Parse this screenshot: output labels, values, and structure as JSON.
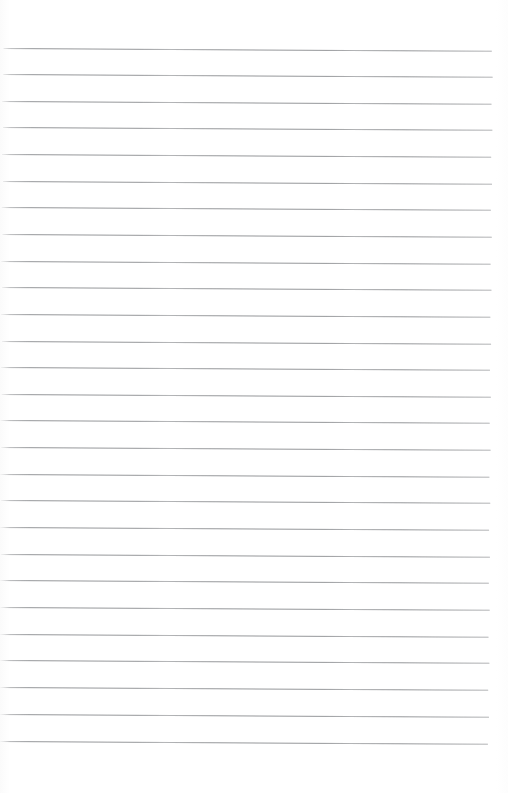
{
  "document": {
    "kind": "lined-paper-scan",
    "title": "Blank ruled notepad page",
    "page_width": 508,
    "page_height": 793,
    "background_color": "#ffffff",
    "rule_color": "#8d8f92",
    "rule_thickness_px": 1,
    "skew_degrees": 0.32,
    "content_text": "",
    "handwriting_present": "no",
    "ruling": {
      "first_rule_y": 48,
      "line_spacing_px": 26.7,
      "rule_count": 27,
      "left_margin_x": 3,
      "right_margin_x": 493,
      "margin_rule_present": "no",
      "header_space_px": 48,
      "footer_space_px": 51
    },
    "rules": [
      {
        "index": 1,
        "y": 48,
        "x1": 4,
        "x2": 492
      },
      {
        "index": 2,
        "y": 74,
        "x1": 4,
        "x2": 493
      },
      {
        "index": 3,
        "y": 101,
        "x1": 3,
        "x2": 492
      },
      {
        "index": 4,
        "y": 127,
        "x1": 4,
        "x2": 493
      },
      {
        "index": 5,
        "y": 154,
        "x1": 3,
        "x2": 492
      },
      {
        "index": 6,
        "y": 181,
        "x1": 4,
        "x2": 493
      },
      {
        "index": 7,
        "y": 207,
        "x1": 3,
        "x2": 492
      },
      {
        "index": 8,
        "y": 234,
        "x1": 4,
        "x2": 493
      },
      {
        "index": 9,
        "y": 261,
        "x1": 3,
        "x2": 492
      },
      {
        "index": 10,
        "y": 287,
        "x1": 4,
        "x2": 493
      },
      {
        "index": 11,
        "y": 314,
        "x1": 3,
        "x2": 492
      },
      {
        "index": 12,
        "y": 341,
        "x1": 4,
        "x2": 493
      },
      {
        "index": 13,
        "y": 367,
        "x1": 3,
        "x2": 492
      },
      {
        "index": 14,
        "y": 394,
        "x1": 4,
        "x2": 493
      },
      {
        "index": 15,
        "y": 420,
        "x1": 3,
        "x2": 492
      },
      {
        "index": 16,
        "y": 447,
        "x1": 4,
        "x2": 493
      },
      {
        "index": 17,
        "y": 474,
        "x1": 3,
        "x2": 492
      },
      {
        "index": 18,
        "y": 500,
        "x1": 4,
        "x2": 493
      },
      {
        "index": 19,
        "y": 527,
        "x1": 3,
        "x2": 492
      },
      {
        "index": 20,
        "y": 554,
        "x1": 4,
        "x2": 493
      },
      {
        "index": 21,
        "y": 580,
        "x1": 3,
        "x2": 492
      },
      {
        "index": 22,
        "y": 607,
        "x1": 4,
        "x2": 493
      },
      {
        "index": 23,
        "y": 634,
        "x1": 3,
        "x2": 492
      },
      {
        "index": 24,
        "y": 660,
        "x1": 4,
        "x2": 493
      },
      {
        "index": 25,
        "y": 687,
        "x1": 3,
        "x2": 492
      },
      {
        "index": 26,
        "y": 714,
        "x1": 4,
        "x2": 493
      },
      {
        "index": 27,
        "y": 741,
        "x1": 3,
        "x2": 492
      }
    ]
  }
}
